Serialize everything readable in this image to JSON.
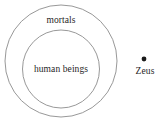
{
  "diagram": {
    "type": "euler-diagram",
    "background_color": "#ffffff",
    "outline_color": "#8c8c8c",
    "text_color": "#1f1f1f",
    "point_color": "#1a1a1a",
    "sets": [
      {
        "name": "outer-set",
        "label": "mortals",
        "shape": "ellipse",
        "center_x": 61,
        "center_y": 61,
        "radius_x": 56,
        "radius_y": 56
      },
      {
        "name": "inner-set",
        "label": "human beings",
        "shape": "ellipse",
        "center_x": 61,
        "center_y": 69,
        "radius_x": 38.5,
        "radius_y": 39
      }
    ],
    "points": [
      {
        "name": "zeus-point",
        "label": "Zeus",
        "x": 144,
        "y": 59,
        "radius": 2.4
      }
    ]
  }
}
